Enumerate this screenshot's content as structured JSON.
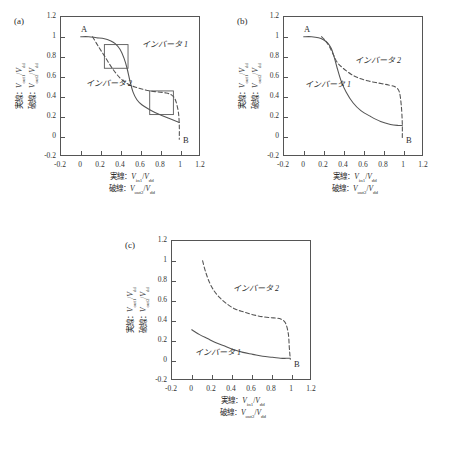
{
  "figure": {
    "background": "#ffffff",
    "ink": "#2b2b2b",
    "curve_color": "#555555"
  },
  "axis_common": {
    "ticks": [
      "-0.2",
      "0",
      "0.2",
      "0.4",
      "0.6",
      "0.8",
      "1",
      "1.2"
    ],
    "tick_values": [
      -0.2,
      0,
      0.2,
      0.4,
      0.6,
      0.8,
      1,
      1.2
    ],
    "xlim": [
      -0.2,
      1.2
    ],
    "ylim": [
      -0.2,
      1.2
    ],
    "xcaption_line1_prefix": "実線：",
    "xcaption_line1_num": "V",
    "xcaption_line1_numsub": "in1",
    "xcaption_line1_den": "V",
    "xcaption_line1_densub": "dd",
    "xcaption_line2_prefix": "破線：",
    "xcaption_line2_num": "V",
    "xcaption_line2_numsub": "out2",
    "xcaption_line2_den": "V",
    "xcaption_line2_densub": "dd",
    "ycaption_line1_prefix": "実線：",
    "ycaption_line1_num": "V",
    "ycaption_line1_numsub": "out1",
    "ycaption_line1_den": "V",
    "ycaption_line1_densub": "dd",
    "ycaption_line2_prefix": "破線：",
    "ycaption_line2_num": "V",
    "ycaption_line2_numsub": "out2",
    "ycaption_line2_den": "V",
    "ycaption_line2_densub": "dd"
  },
  "panels": [
    {
      "tag": "(a)",
      "inverter1_label": "インバータ 1",
      "inverter2_label": "インバータ 2",
      "point_a": "A",
      "point_b": "B"
    },
    {
      "tag": "(b)",
      "inverter1_label": "インバータ 1",
      "inverter2_label": "インバータ 2",
      "point_a": "A",
      "point_b": "B"
    },
    {
      "tag": "(c)",
      "inverter1_label": "インバータ 1",
      "inverter2_label": "インバータ 2",
      "point_b": "B"
    }
  ],
  "chart_data": [
    {
      "type": "line",
      "title": "(a)",
      "xlabel": "実線：V_in1/V_dd ; 破線：V_out2/V_dd",
      "ylabel": "実線：V_out1/V_dd ; 破線：V_out2/V_dd",
      "xlim": [
        -0.2,
        1.2
      ],
      "ylim": [
        -0.2,
        1.2
      ],
      "grid": false,
      "legend_position": "in-plot-annotation",
      "annotations": [
        {
          "text": "A",
          "x": 0.0,
          "y": 1.0
        },
        {
          "text": "B",
          "x": 1.0,
          "y": 0.0
        },
        {
          "text": "インバータ 1",
          "x": 0.62,
          "y": 0.92
        },
        {
          "text": "インバータ 2",
          "x": 0.06,
          "y": 0.53
        }
      ],
      "markers": [
        {
          "shape": "open-square",
          "x": 0.36,
          "y": 0.8
        },
        {
          "shape": "open-square",
          "x": 0.82,
          "y": 0.33
        }
      ],
      "series": [
        {
          "name": "インバータ 1",
          "style": "solid",
          "x": [
            0.0,
            0.08,
            0.16,
            0.24,
            0.3,
            0.35,
            0.4,
            0.44,
            0.47,
            0.5,
            0.53,
            0.57,
            0.62,
            0.7,
            0.8,
            0.9,
            1.0
          ],
          "y": [
            1.0,
            1.0,
            0.99,
            0.98,
            0.96,
            0.93,
            0.87,
            0.78,
            0.68,
            0.55,
            0.44,
            0.36,
            0.31,
            0.26,
            0.21,
            0.17,
            0.13
          ]
        },
        {
          "name": "インバータ 2",
          "style": "dashed",
          "x": [
            0.12,
            0.18,
            0.25,
            0.32,
            0.4,
            0.48,
            0.55,
            0.62,
            0.7,
            0.78,
            0.86,
            0.92,
            0.96,
            0.99,
            1.0,
            1.0
          ],
          "y": [
            1.0,
            0.9,
            0.79,
            0.68,
            0.58,
            0.52,
            0.49,
            0.47,
            0.45,
            0.44,
            0.43,
            0.41,
            0.36,
            0.24,
            0.1,
            -0.04
          ]
        }
      ]
    },
    {
      "type": "line",
      "title": "(b)",
      "xlabel": "実線：V_in1/V_dd ; 破線：V_out2/V_dd",
      "ylabel": "実線：V_out1/V_dd ; 破線：V_out2/V_dd",
      "xlim": [
        -0.2,
        1.2
      ],
      "ylim": [
        -0.2,
        1.2
      ],
      "grid": false,
      "legend_position": "in-plot-annotation",
      "annotations": [
        {
          "text": "A",
          "x": 0.0,
          "y": 1.0
        },
        {
          "text": "B",
          "x": 1.0,
          "y": 0.0
        },
        {
          "text": "インバータ 1",
          "x": 0.02,
          "y": 0.52
        },
        {
          "text": "インバータ 2",
          "x": 0.52,
          "y": 0.76
        }
      ],
      "markers": [],
      "series": [
        {
          "name": "インバータ 1",
          "style": "solid",
          "x": [
            0.0,
            0.08,
            0.15,
            0.2,
            0.24,
            0.28,
            0.31,
            0.34,
            0.38,
            0.43,
            0.5,
            0.58,
            0.68,
            0.78,
            0.88,
            0.96,
            1.0
          ],
          "y": [
            1.0,
            1.0,
            0.99,
            0.97,
            0.94,
            0.88,
            0.79,
            0.68,
            0.55,
            0.44,
            0.33,
            0.25,
            0.19,
            0.14,
            0.11,
            0.1,
            0.1
          ]
        },
        {
          "name": "インバータ 2",
          "style": "dashed",
          "x": [
            0.18,
            0.22,
            0.26,
            0.3,
            0.34,
            0.4,
            0.48,
            0.56,
            0.66,
            0.76,
            0.86,
            0.93,
            0.97,
            0.99,
            1.0,
            1.0
          ],
          "y": [
            1.0,
            0.96,
            0.9,
            0.82,
            0.74,
            0.68,
            0.62,
            0.58,
            0.55,
            0.53,
            0.51,
            0.49,
            0.44,
            0.3,
            0.12,
            -0.04
          ]
        }
      ]
    },
    {
      "type": "line",
      "title": "(c)",
      "xlabel": "実線：V_in1/V_dd ; 破線：V_out2/V_dd",
      "ylabel": "実線：V_out1/V_dd ; 破線：V_out2/V_dd",
      "xlim": [
        -0.2,
        1.2
      ],
      "ylim": [
        -0.2,
        1.2
      ],
      "grid": false,
      "legend_position": "in-plot-annotation",
      "annotations": [
        {
          "text": "B",
          "x": 1.0,
          "y": 0.0
        },
        {
          "text": "インバータ 1",
          "x": 0.04,
          "y": 0.08
        },
        {
          "text": "インバータ 2",
          "x": 0.42,
          "y": 0.72
        }
      ],
      "markers": [],
      "series": [
        {
          "name": "インバータ 1",
          "style": "solid",
          "x": [
            0.0,
            0.08,
            0.16,
            0.24,
            0.32,
            0.42,
            0.52,
            0.62,
            0.72,
            0.82,
            0.9,
            0.96,
            1.0
          ],
          "y": [
            0.3,
            0.25,
            0.21,
            0.17,
            0.14,
            0.1,
            0.07,
            0.05,
            0.03,
            0.02,
            0.01,
            0.01,
            0.01
          ]
        },
        {
          "name": "インバータ 2",
          "style": "dashed",
          "x": [
            0.11,
            0.14,
            0.18,
            0.23,
            0.29,
            0.36,
            0.44,
            0.53,
            0.63,
            0.73,
            0.83,
            0.9,
            0.95,
            0.98,
            0.99,
            1.0
          ],
          "y": [
            1.0,
            0.89,
            0.78,
            0.69,
            0.62,
            0.56,
            0.51,
            0.48,
            0.45,
            0.43,
            0.42,
            0.41,
            0.37,
            0.26,
            0.12,
            0.0
          ]
        }
      ]
    }
  ]
}
